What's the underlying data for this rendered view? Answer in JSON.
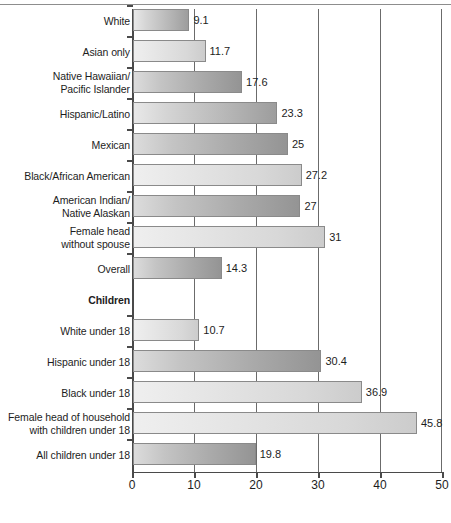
{
  "chart_data": {
    "type": "bar",
    "orientation": "horizontal",
    "title": "",
    "xlabel": "",
    "ylabel": "",
    "xlim": [
      0,
      50
    ],
    "xticks": [
      0,
      10,
      20,
      30,
      40,
      50
    ],
    "grid": true,
    "legend": false,
    "categories": [
      "White",
      "Asian only",
      "Native Hawaiian/\nPacific Islander",
      "Hispanic/Latino",
      "Mexican",
      "Black/African American",
      "American Indian/\nNative Alaskan",
      "Female head\nwithout spouse",
      "Overall",
      "Children",
      "White under 18",
      "Hispanic under 18",
      "Black under 18",
      "Female head of household\nwith children under 18",
      "All children under 18"
    ],
    "values": [
      9.1,
      11.7,
      17.6,
      23.3,
      25,
      27.2,
      27,
      31,
      14.3,
      null,
      10.7,
      30.4,
      36.9,
      45.8,
      19.8
    ],
    "value_labels": [
      "9.1",
      "11.7",
      "17.6",
      "23.3",
      "25",
      "27.2",
      "27",
      "31",
      "14.3",
      "",
      "10.7",
      "30.4",
      "36.9",
      "45.8",
      "19.8"
    ],
    "section_headers": [
      "Children"
    ],
    "bar_styles": [
      "mid",
      "light",
      "dark",
      "mid",
      "dark",
      "light",
      "dark",
      "light",
      "dark",
      "none",
      "light",
      "dark",
      "light",
      "light",
      "dark"
    ],
    "colors": {
      "bar_light": "#e6e6e6",
      "bar_mid": "#c8c8c8",
      "bar_dark": "#a9a9a9",
      "bar_border": "#8a8a8a",
      "axis": "#4a4a4a",
      "gridline": "#6b6b6b",
      "text": "#1d1d1d",
      "background": "#ffffff"
    }
  }
}
